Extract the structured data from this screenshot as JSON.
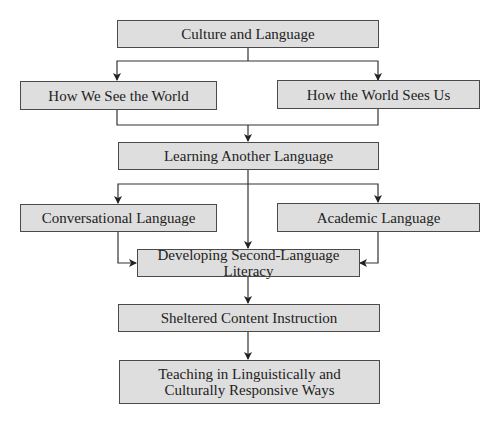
{
  "diagram": {
    "type": "flowchart",
    "colors": {
      "box_fill": "#dedede",
      "box_border": "#4a4a4a",
      "line": "#333333",
      "text": "#222222",
      "background": "#ffffff"
    },
    "nodes": {
      "culture_and_language": {
        "label": "Culture and Language"
      },
      "how_we_see_the_world": {
        "label": "How We See the World"
      },
      "how_the_world_sees_us": {
        "label": "How the World Sees Us"
      },
      "learning_another_language": {
        "label": "Learning Another Language"
      },
      "conversational_language": {
        "label": "Conversational Language"
      },
      "academic_language": {
        "label": "Academic Language"
      },
      "developing_second_language_literacy": {
        "label": "Developing Second-Language Literacy"
      },
      "sheltered_content_instruction": {
        "label": "Sheltered Content Instruction"
      },
      "teaching_responsive": {
        "label_line1": "Teaching in Linguistically and",
        "label_line2": "Culturally Responsive Ways"
      }
    },
    "edges": [
      {
        "from": "Culture and Language",
        "to": "How We See the World"
      },
      {
        "from": "Culture and Language",
        "to": "How the World Sees Us"
      },
      {
        "from": "How We See the World",
        "to": "Learning Another Language"
      },
      {
        "from": "How the World Sees Us",
        "to": "Learning Another Language"
      },
      {
        "from": "Learning Another Language",
        "to": "Conversational Language"
      },
      {
        "from": "Learning Another Language",
        "to": "Academic Language"
      },
      {
        "from": "Learning Another Language",
        "to": "Developing Second-Language Literacy"
      },
      {
        "from": "Conversational Language",
        "to": "Developing Second-Language Literacy"
      },
      {
        "from": "Academic Language",
        "to": "Developing Second-Language Literacy"
      },
      {
        "from": "Developing Second-Language Literacy",
        "to": "Sheltered Content Instruction"
      },
      {
        "from": "Sheltered Content Instruction",
        "to": "Teaching in Linguistically and Culturally Responsive Ways"
      }
    ]
  }
}
